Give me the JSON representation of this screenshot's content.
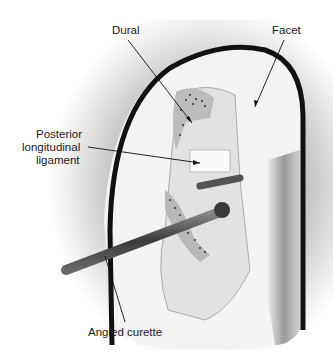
{
  "figure": {
    "type": "medical-illustration",
    "labels": {
      "dural": "Dural",
      "facet": "Facet",
      "pll_line1": "Posterior",
      "pll_line2": "longitudinal",
      "pll_line3": "ligament",
      "curette": "Angled curette"
    },
    "colors": {
      "background": "#ffffff",
      "vignette": "#c8c8c8",
      "outline": "#111111",
      "bone": "#f4f4f4",
      "instrument": "#555555"
    }
  }
}
